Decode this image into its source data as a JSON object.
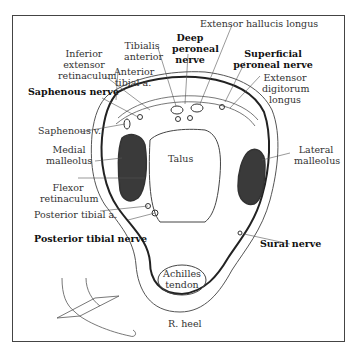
{
  "figure": {
    "title_labels": {
      "extensor_hallucis_longus": "Extensor hallucis longus",
      "deep_peroneal_nerve_1": "Deep",
      "deep_peroneal_nerve_2": "peroneal",
      "deep_peroneal_nerve_3": "nerve",
      "superficial_peroneal_nerve_1": "Superficial",
      "superficial_peroneal_nerve_2": "peroneal nerve",
      "tibialis_anterior_1": "Tibialis",
      "tibialis_anterior_2": "anterior",
      "inferior_extensor_retinaculum_1": "Inferior",
      "inferior_extensor_retinaculum_2": "extensor",
      "inferior_extensor_retinaculum_3": "retinaculum",
      "anterior_tibial_a_1": "Anterior",
      "anterior_tibial_a_2": "tibial a.",
      "extensor_digitorum_longus_1": "Extensor",
      "extensor_digitorum_longus_2": "digitorum",
      "extensor_digitorum_longus_3": "longus",
      "saphenous_nerve": "Saphenous nerve",
      "saphenous_v": "Saphenous v.",
      "medial_malleolus_1": "Medial",
      "medial_malleolus_2": "malleolus",
      "talus": "Talus",
      "lateral_malleolus_1": "Lateral",
      "lateral_malleolus_2": "malleolus",
      "flexor_retinaculum_1": "Flexor",
      "flexor_retinaculum_2": "retinaculum",
      "posterior_tibial_a": "Posterior tibial a.",
      "posterior_tibial_nerve": "Posterior tibial nerve",
      "sural_nerve": "Sural nerve",
      "achilles_tendon_1": "Achilles",
      "achilles_tendon_2": "tendon",
      "r_heel": "R. heel"
    },
    "colors": {
      "line": "#333333",
      "bone_fill": "#444444",
      "frame": "#444444"
    }
  }
}
